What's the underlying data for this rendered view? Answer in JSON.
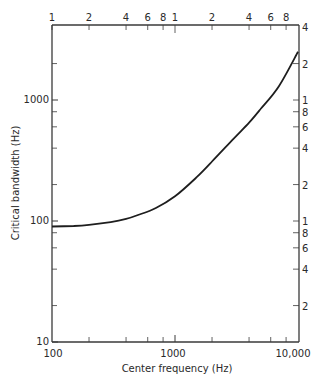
{
  "chart_data": {
    "type": "line",
    "title": "",
    "xlabel": "Center frequency (Hz)",
    "ylabel": "Critical bandwidth (Hz)",
    "xscale": "log",
    "yscale": "log",
    "xlim": [
      100,
      10000
    ],
    "ylim": [
      10,
      4000
    ],
    "grid": false,
    "x_tick_labels": [
      "100",
      "1000",
      "10,000"
    ],
    "y_tick_labels": [
      "10",
      "100",
      "1000"
    ],
    "top_axis_labels": [
      "1",
      "2",
      "4",
      "6",
      "8",
      "1",
      "2",
      "4",
      "6",
      "8"
    ],
    "right_axis_labels": [
      "4",
      "2",
      "1",
      "8",
      "6",
      "4",
      "2",
      "1",
      "8",
      "6",
      "4",
      "2"
    ],
    "series": [
      {
        "name": "Critical bandwidth",
        "x": [
          100,
          150,
          200,
          300,
          400,
          500,
          700,
          1000,
          1500,
          2000,
          3000,
          4000,
          5000,
          7000,
          10000
        ],
        "y": [
          90,
          91,
          93,
          98,
          104,
          112,
          128,
          160,
          230,
          310,
          480,
          650,
          850,
          1300,
          2500
        ]
      }
    ]
  },
  "labels": {
    "xlabel": "Center frequency (Hz)",
    "ylabel": "Critical bandwidth (Hz)",
    "x100": "100",
    "x1000": "1000",
    "x10000": "10,000",
    "y10": "10",
    "y100": "100",
    "y1000": "1000",
    "top": [
      "1",
      "2",
      "4",
      "6",
      "8",
      "1",
      "2",
      "4",
      "6",
      "8"
    ],
    "right": [
      "4",
      "2",
      "1",
      "8",
      "6",
      "4",
      "2",
      "1",
      "8",
      "6",
      "4",
      "2"
    ]
  }
}
